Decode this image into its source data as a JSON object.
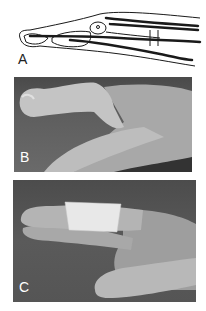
{
  "figure": {
    "panels": [
      {
        "id": "A",
        "label": "A",
        "type": "anatomical-drawing",
        "description": "Lateral line drawing of a finger showing bones, extensor and flexor tendons"
      },
      {
        "id": "B",
        "label": "B",
        "type": "photograph",
        "description": "Hand with flexed finger deformity at distal joint"
      },
      {
        "id": "C",
        "label": "C",
        "type": "photograph",
        "description": "Finger immobilised with white tape splint"
      }
    ]
  },
  "colors": {
    "background": "#ffffff",
    "drawing_line": "#1a1a1a",
    "photo_bg": "#555555",
    "skin": "#b8b8b8",
    "tape": "#e8e8e8"
  }
}
